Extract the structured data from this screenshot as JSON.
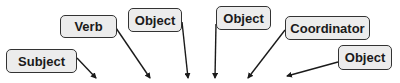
{
  "diagram": {
    "type": "sentence-role-labels",
    "colors": {
      "background": "#ffffff",
      "node_fill": "#ececec",
      "node_border": "#333333",
      "text": "#1a1a1a",
      "arrow": "#1a1a1a"
    },
    "nodes": [
      {
        "id": "subject",
        "label": "Subject",
        "x": 6,
        "y": 49,
        "w": 71,
        "h": 24
      },
      {
        "id": "verb",
        "label": "Verb",
        "x": 60,
        "y": 15,
        "w": 57,
        "h": 23
      },
      {
        "id": "object1",
        "label": "Object",
        "x": 128,
        "y": 8,
        "w": 54,
        "h": 24
      },
      {
        "id": "object2",
        "label": "Object",
        "x": 216,
        "y": 6,
        "w": 55,
        "h": 24
      },
      {
        "id": "coordinator",
        "label": "Coordinator",
        "x": 285,
        "y": 16,
        "w": 85,
        "h": 24
      },
      {
        "id": "object3",
        "label": "Object",
        "x": 338,
        "y": 45,
        "w": 54,
        "h": 25
      }
    ],
    "arrows": [
      {
        "from": "subject",
        "x1": 77,
        "y1": 58,
        "x2": 96,
        "y2": 78
      },
      {
        "from": "verb",
        "x1": 116,
        "y1": 28,
        "x2": 150,
        "y2": 78
      },
      {
        "from": "object1",
        "x1": 182,
        "y1": 22,
        "x2": 188,
        "y2": 78
      },
      {
        "from": "object2",
        "x1": 216,
        "y1": 24,
        "x2": 215,
        "y2": 78
      },
      {
        "from": "coordinator",
        "x1": 285,
        "y1": 30,
        "x2": 248,
        "y2": 78
      },
      {
        "from": "object3",
        "x1": 338,
        "y1": 62,
        "x2": 287,
        "y2": 76
      }
    ]
  }
}
